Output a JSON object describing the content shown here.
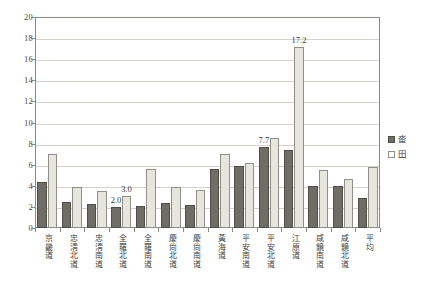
{
  "chart_data": {
    "type": "bar",
    "title": "",
    "xlabel": "",
    "ylabel": "",
    "ylim": [
      0,
      20
    ],
    "ytick_step": 2,
    "yticks": [
      "20",
      "18",
      "16",
      "14",
      "12",
      "10",
      "8",
      "6",
      "4",
      "2",
      "0"
    ],
    "grid": true,
    "legend_position": "right",
    "categories": [
      "京畿道",
      "忠淸北道",
      "忠淸南道",
      "全羅北道",
      "全羅南道",
      "慶尙北道",
      "慶尙南道",
      "黃海道",
      "平安南道",
      "平安北道",
      "江原道",
      "咸鏡南道",
      "咸鏡北道",
      "平均"
    ],
    "series": [
      {
        "name": "畓",
        "color": "#6e6e66",
        "values": [
          4.4,
          2.5,
          2.3,
          2.0,
          2.1,
          2.35,
          2.2,
          5.55,
          5.9,
          7.7,
          7.35,
          3.95,
          4.0,
          2.8
        ]
      },
      {
        "name": "田",
        "color": "#e6e6de",
        "values": [
          7.0,
          3.9,
          3.5,
          3.0,
          5.6,
          3.9,
          3.6,
          7.0,
          6.2,
          8.5,
          17.2,
          5.5,
          4.6,
          5.75
        ]
      }
    ],
    "annotations": [
      {
        "text": "2.0",
        "category_index": 3,
        "series_index": 0,
        "value": 2.0
      },
      {
        "text": "3.0",
        "category_index": 3,
        "series_index": 1,
        "value": 3.0
      },
      {
        "text": "7.7",
        "category_index": 9,
        "series_index": 0,
        "value": 7.7
      },
      {
        "text": "17.2",
        "category_index": 10,
        "series_index": 1,
        "value": 17.2
      }
    ]
  },
  "legend": {
    "items": [
      {
        "label": "畓",
        "swatch": "series-dap"
      },
      {
        "label": "田",
        "swatch": "series-jeon"
      }
    ]
  }
}
